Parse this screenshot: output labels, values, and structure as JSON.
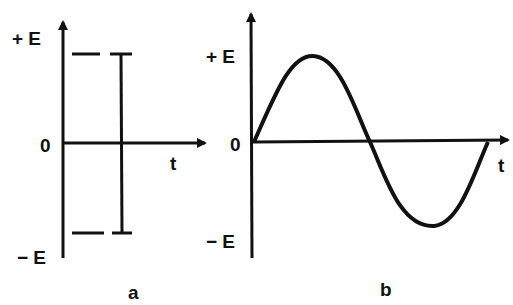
{
  "panels": [
    {
      "id": "a",
      "caption": "a",
      "y_top_label": "+ E",
      "y_zero_label": "0",
      "y_bottom_label": "− E",
      "x_axis_label": "t",
      "signal": "DC (constant ±E levels with transition)"
    },
    {
      "id": "b",
      "caption": "b",
      "y_top_label": "+ E",
      "y_zero_label": "0",
      "y_bottom_label": "− E",
      "x_axis_label": "t",
      "signal": "sine wave, one period"
    }
  ],
  "colors": {
    "ink": "#111111",
    "background": "#ffffff"
  }
}
